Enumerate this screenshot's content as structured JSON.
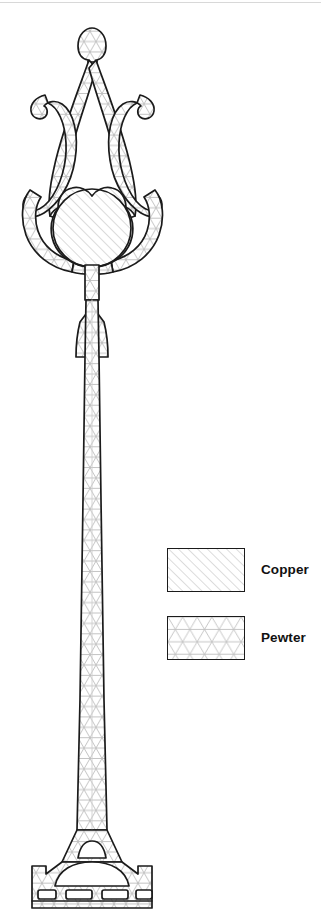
{
  "figure": {
    "background_color": "#ffffff",
    "outline_color": "#1b1b1b",
    "hatch_color": "#b9b9b9",
    "materials": {
      "copper": {
        "name": "Copper",
        "hatch_type": "diagonal-lines",
        "hatch_angle_deg": 45,
        "hatch_spacing_px": 7,
        "color": "#b9b9b9"
      },
      "pewter": {
        "name": "Pewter",
        "hatch_type": "triangular-mesh",
        "hatch_spacing_px": 11,
        "color": "#b9b9b9"
      }
    },
    "parts": [
      {
        "name": "top-cap",
        "material": "pewter"
      },
      {
        "name": "left-scroll-arm",
        "material": "pewter"
      },
      {
        "name": "right-scroll-arm",
        "material": "pewter"
      },
      {
        "name": "left-hook-terminal",
        "material": "pewter"
      },
      {
        "name": "right-hook-terminal",
        "material": "pewter"
      },
      {
        "name": "left-inner-strut",
        "material": "pewter"
      },
      {
        "name": "right-inner-strut",
        "material": "pewter"
      },
      {
        "name": "cradle-ring",
        "material": "pewter"
      },
      {
        "name": "central-globe",
        "material": "copper"
      },
      {
        "name": "collar-flare",
        "material": "pewter"
      },
      {
        "name": "main-shaft",
        "material": "pewter"
      },
      {
        "name": "base-plinth",
        "material": "pewter"
      },
      {
        "name": "base-dome",
        "material": "pewter"
      },
      {
        "name": "base-slots",
        "material": "void"
      }
    ]
  },
  "legend": {
    "position": "right-middle",
    "items": [
      {
        "label": "Copper",
        "material": "copper"
      },
      {
        "label": "Pewter",
        "material": "pewter"
      }
    ]
  }
}
